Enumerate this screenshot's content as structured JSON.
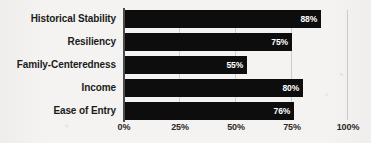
{
  "chart_data": {
    "type": "bar",
    "orientation": "horizontal",
    "title": "",
    "xlabel": "",
    "ylabel": "",
    "categories": [
      "Historical Stability",
      "Resiliency",
      "Family-Centeredness",
      "Income",
      "Ease of Entry"
    ],
    "values": [
      88,
      75,
      55,
      80,
      76
    ],
    "value_labels": [
      "88%",
      "75%",
      "55%",
      "80%",
      "76%"
    ],
    "xlim": [
      0,
      100
    ],
    "xticks": [
      0,
      25,
      50,
      75,
      100
    ],
    "xtick_labels": [
      "0%",
      "25%",
      "50%",
      "75%",
      "100%"
    ],
    "grid": true,
    "grid_axis": "x",
    "legend": false,
    "bar_color": "#0d0d0d",
    "value_label_color": "#ffffff",
    "background_color": "#f4f3f1",
    "axis_color": "#4a4a4a",
    "gridline_color": "#cfcdc9"
  }
}
